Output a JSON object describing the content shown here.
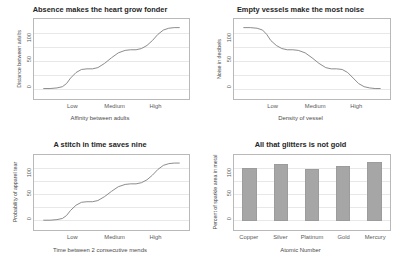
{
  "figure": {
    "background": "#ffffff",
    "panel_count": 4
  },
  "chart_data": [
    {
      "type": "line",
      "title": "Absence makes the heart grow fonder",
      "xlabel": "Affinity between adults",
      "ylabel": "Distance between adults",
      "yticks": [
        "0",
        "50",
        "100"
      ],
      "xticks": [
        "Low",
        "Medium",
        "High"
      ],
      "ylim": [
        -15,
        115
      ],
      "grid": true,
      "x": [
        0,
        5,
        10,
        14,
        17,
        20,
        24,
        28,
        32,
        36,
        40,
        45,
        50,
        55,
        60,
        64,
        68,
        72,
        76,
        80,
        84,
        88,
        92,
        96,
        100
      ],
      "values": [
        2,
        2,
        3,
        5,
        10,
        19,
        28,
        33,
        34,
        34,
        36,
        43,
        52,
        60,
        64,
        65,
        65,
        67,
        72,
        80,
        90,
        97,
        100,
        101,
        101
      ]
    },
    {
      "type": "line",
      "title": "Empty vessels make the most noise",
      "xlabel": "Density of vessel",
      "ylabel": "Noise in decibels",
      "yticks": [
        "0",
        "50",
        "100"
      ],
      "xticks": [
        "Low",
        "Medium",
        "High"
      ],
      "ylim": [
        -15,
        115
      ],
      "grid": true,
      "x": [
        0,
        5,
        10,
        14,
        17,
        20,
        24,
        28,
        32,
        36,
        40,
        45,
        50,
        55,
        60,
        64,
        68,
        72,
        76,
        80,
        84,
        88,
        92,
        96,
        100
      ],
      "values": [
        101,
        101,
        100,
        97,
        90,
        80,
        72,
        67,
        65,
        65,
        64,
        60,
        52,
        43,
        36,
        34,
        34,
        33,
        28,
        19,
        10,
        5,
        3,
        2,
        2
      ]
    },
    {
      "type": "line",
      "title": "A stitch in time saves nine",
      "xlabel": "Time between 2 consecutive mends",
      "ylabel": "Probability of apparel tear",
      "yticks": [
        "0",
        "50",
        "100"
      ],
      "xticks": [
        "Low",
        "Medium",
        "High"
      ],
      "ylim": [
        -15,
        115
      ],
      "grid": true,
      "x": [
        0,
        5,
        10,
        14,
        17,
        20,
        24,
        28,
        32,
        36,
        40,
        45,
        50,
        55,
        60,
        64,
        68,
        72,
        76,
        80,
        84,
        88,
        92,
        96,
        100
      ],
      "values": [
        2,
        2,
        3,
        5,
        10,
        19,
        28,
        33,
        34,
        34,
        36,
        43,
        52,
        60,
        64,
        65,
        65,
        67,
        72,
        80,
        90,
        97,
        100,
        101,
        101
      ]
    },
    {
      "type": "bar",
      "title": "All that glitters is not gold",
      "xlabel": "Atomic Number",
      "ylabel": "Percent of sparkle area in metal",
      "yticks": [
        "0",
        "50",
        "100"
      ],
      "categories": [
        "Copper",
        "Silver",
        "Platinum",
        "Gold",
        "Mercury"
      ],
      "values": [
        93,
        99,
        91,
        96,
        103
      ],
      "ylim": [
        -15,
        115
      ],
      "grid": true,
      "bar_color": "#a6a6a6"
    }
  ]
}
